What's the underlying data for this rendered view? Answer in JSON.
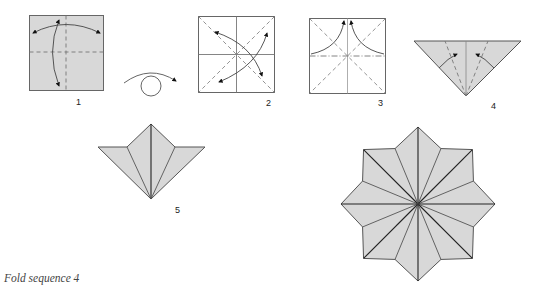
{
  "figure": {
    "caption": "Fold sequence 4",
    "colors": {
      "paper_fill": "#d8d8d8",
      "paper_white": "#ffffff",
      "line": "#555555",
      "crease": "#777777",
      "arrow": "#111111"
    },
    "steps": [
      {
        "number": "1",
        "label": "1",
        "description": "Gray square with vertical and horizontal valley-fold creases; curved arrows fold in half both ways and unfold"
      },
      {
        "number": "",
        "label": "",
        "description": "Turn over symbol: curved arrow over circle"
      },
      {
        "number": "2",
        "label": "2",
        "description": "White square with center creases; diagonal valley folds with curved arrows"
      },
      {
        "number": "3",
        "label": "3",
        "description": "Square with diagonal valley creases and horizontal mountain fold; corners brought to top"
      },
      {
        "number": "4",
        "label": "4",
        "description": "Gray triangle (preliminary base) with dashed folds; flaps fold to center"
      },
      {
        "number": "5",
        "label": "5",
        "description": "Folded unit with kite-shaped flaps"
      },
      {
        "number": "",
        "label": "",
        "description": "Completed eight-pointed star assembled from units"
      }
    ]
  }
}
